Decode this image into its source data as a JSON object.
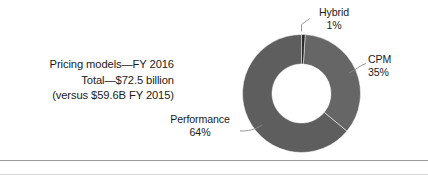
{
  "caption": {
    "lines": [
      "Pricing models—FY 2016",
      "Total—$72.5 billion",
      "(versus $59.6B FY 2015)"
    ]
  },
  "chart_data": {
    "type": "pie",
    "variant": "donut",
    "title": "Pricing models—FY 2016",
    "subtitle": "Total—$72.5 billion",
    "note": "(versus $59.6B FY 2015)",
    "total_label": "Total—$72.5 billion",
    "total_value": 72.5,
    "total_units": "billion USD",
    "prior_year_label": "(versus $59.6B FY 2015)",
    "prior_year_value": 59.6,
    "fiscal_year": "FY 2016",
    "categories": [
      "Performance",
      "CPM",
      "Hybrid"
    ],
    "values": [
      64,
      35,
      1
    ],
    "value_labels": [
      "64%",
      "35%",
      "1%"
    ],
    "colors": [
      "#5e5e5e",
      "#666666",
      "#2b2b2b"
    ],
    "inner_radius_ratio": 0.5,
    "start_angle_deg": 0,
    "direction": "counterclockwise",
    "legend": "none",
    "grid": false,
    "xlabel": "",
    "ylabel": "",
    "slices": [
      {
        "name": "Performance",
        "pct": 64,
        "pct_label": "64%",
        "color": "#5e5e5e"
      },
      {
        "name": "CPM",
        "pct": 35,
        "pct_label": "35%",
        "color": "#666666"
      },
      {
        "name": "Hybrid",
        "pct": 1,
        "pct_label": "1%",
        "color": "#2b2b2b"
      }
    ]
  },
  "callouts": {
    "hybrid": {
      "name": "Hybrid",
      "pct": "1%"
    },
    "cpm": {
      "name": "CPM",
      "pct": "35%"
    },
    "performance": {
      "name": "Performance",
      "pct": "64%"
    }
  },
  "style": {
    "background": "#ffffff",
    "text_color": "#1b1b1b",
    "rule_color": "#9a9a9a",
    "leader_color": "#8c8c8c"
  }
}
